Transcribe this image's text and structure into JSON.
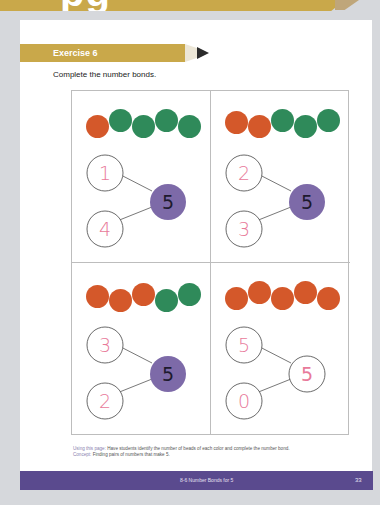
{
  "header": {
    "title_fragment": "pg"
  },
  "exercise": {
    "label": "Exercise 6",
    "instruction": "Complete the number bonds."
  },
  "colors": {
    "banner": "#c9a84a",
    "orange_bead": "#d4582a",
    "green_bead": "#2f8a5a",
    "whole_fill": "#7d6aa8",
    "answer_text": "#e87a9a",
    "footer": "#5a4a8e"
  },
  "problems": [
    {
      "beads": [
        "orange",
        "green",
        "green",
        "green",
        "green"
      ],
      "part_top": "1",
      "part_bottom": "4",
      "whole": "5",
      "whole_filled": true
    },
    {
      "beads": [
        "orange",
        "orange",
        "green",
        "green",
        "green"
      ],
      "part_top": "2",
      "part_bottom": "3",
      "whole": "5",
      "whole_filled": true
    },
    {
      "beads": [
        "orange",
        "orange",
        "orange",
        "green",
        "green"
      ],
      "part_top": "3",
      "part_bottom": "2",
      "whole": "5",
      "whole_filled": true
    },
    {
      "beads": [
        "orange",
        "orange",
        "orange",
        "orange",
        "orange"
      ],
      "part_top": "5",
      "part_bottom": "0",
      "whole": "5",
      "whole_filled": false
    }
  ],
  "footnote": {
    "using_label": "Using this page:",
    "using_text": " Have students identify the number of beads of each color and complete the number bond.",
    "concept_label": "Concept:",
    "concept_text": " Finding pairs of numbers that make 5."
  },
  "footer": {
    "lesson_title": "8-6  Number Bonds for 5",
    "page_number": "33"
  }
}
